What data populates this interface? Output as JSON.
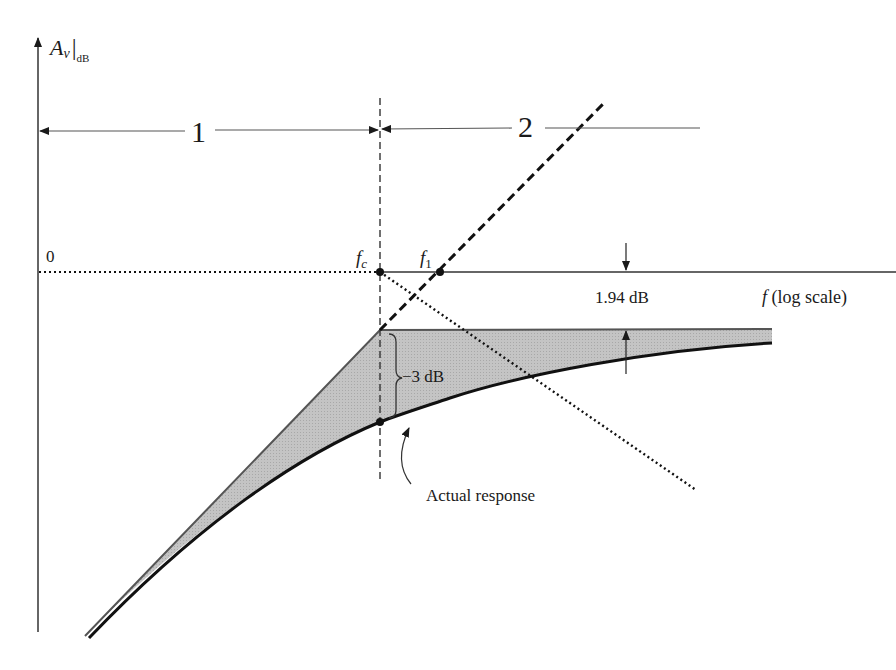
{
  "diagram": {
    "y_axis": {
      "label_main": "A",
      "label_sub_var": "v",
      "label_unit": "dB"
    },
    "x_axis": {
      "label_var": "f",
      "label_text": " (log scale)"
    },
    "origin_label": "0",
    "points": {
      "fc_var": "f",
      "fc_sub": "c",
      "f1_var": "f",
      "f1_sub": "1"
    },
    "regions": [
      {
        "label": "1"
      },
      {
        "label": "2"
      }
    ],
    "annotations": {
      "deviation_at_fc": "−3 dB",
      "deviation_at_f1": "1.94 dB",
      "actual_response": "Actual response"
    },
    "colors": {
      "line": "#1a1a1a",
      "fill": "#bdbdbd",
      "axis": "#555555"
    }
  }
}
